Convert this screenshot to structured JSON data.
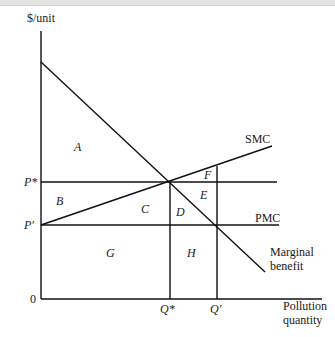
{
  "diagram": {
    "y_axis_label": "$/unit",
    "x_axis_label_line1": "Pollution",
    "x_axis_label_line2": "quantity",
    "origin": "0",
    "price_labels": {
      "p_star": "P*",
      "p_prime": "P′"
    },
    "quantity_labels": {
      "q_star": "Q*",
      "q_prime": "Q′"
    },
    "curves": {
      "smc": "SMC",
      "pmc": "PMC",
      "mb_line1": "Marginal",
      "mb_line2": "benefit"
    },
    "areas": {
      "a": "A",
      "b": "B",
      "c": "C",
      "d": "D",
      "e": "E",
      "f": "F",
      "g": "G",
      "h": "H"
    }
  }
}
